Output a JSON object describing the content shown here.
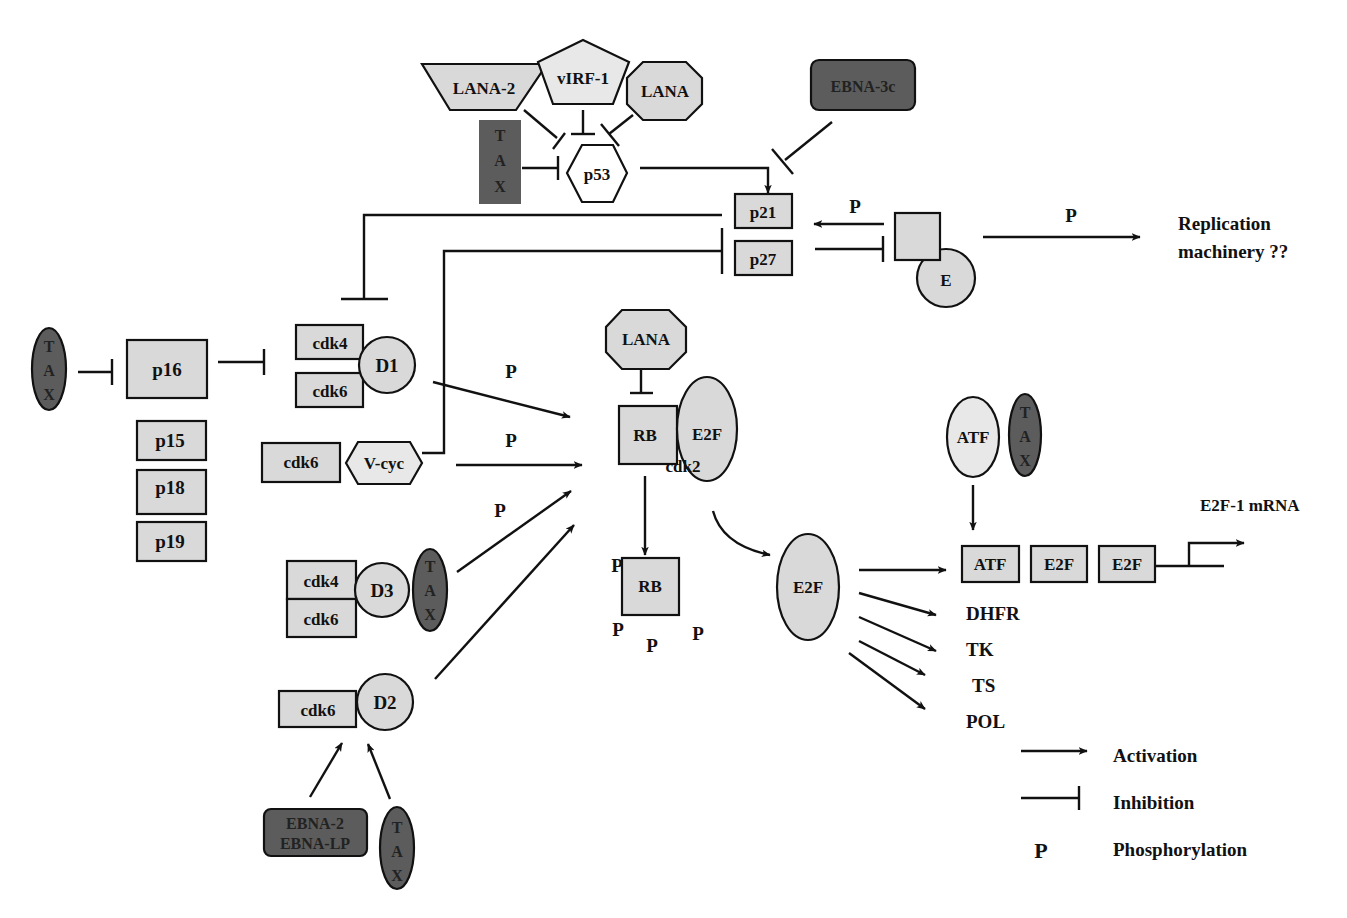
{
  "nodes": {
    "lana2": "LANA-2",
    "virf1": "vIRF-1",
    "lana_top": "LANA",
    "ebna3c": "EBNA-3c",
    "tax_top": [
      "T",
      "A",
      "X"
    ],
    "p53": "p53",
    "p21": "p21",
    "p27": "p27",
    "cyclin_e": "E",
    "tax_left": [
      "T",
      "A",
      "X"
    ],
    "p16": "p16",
    "p15": "p15",
    "p18": "p18",
    "p19": "p19",
    "cdk4_d1": "cdk4",
    "cdk6_d1": "cdk6",
    "d1": "D1",
    "cdk6_vcyc": "cdk6",
    "vcyc": "V-cyc",
    "cdk4_d3": "cdk4",
    "cdk6_d3": "cdk6",
    "d3": "D3",
    "tax_d3": [
      "T",
      "A",
      "X"
    ],
    "cdk6_d2": "cdk6",
    "d2": "D2",
    "ebna2_line1": "EBNA-2",
    "ebna2_line2": "EBNA-LP",
    "tax_bottom": [
      "T",
      "A",
      "X"
    ],
    "lana_mid": "LANA",
    "rb": "RB",
    "e2f_complex": "E2F",
    "cdk2": "cdk2",
    "rb_phos": "RB",
    "e2f_free": "E2F",
    "atf": "ATF",
    "tax_atf": [
      "T",
      "A",
      "X"
    ],
    "promoter_atf": "ATF",
    "promoter_e2f1": "E2F",
    "promoter_e2f2": "E2F"
  },
  "labels": {
    "replication_line1": "Replication",
    "replication_line2": "machinery ??",
    "e2f1_mrna": "E2F-1 mRNA",
    "phospho": "P",
    "targets": [
      "DHFR",
      "TK",
      "TS",
      "POL"
    ]
  },
  "legend": {
    "activation": "Activation",
    "inhibition": "Inhibition",
    "phosphorylation_symbol": "P",
    "phosphorylation": "Phosphorylation"
  },
  "colors": {
    "light_fill": "#d9d9d9",
    "dark_fill": "#5c5c5c",
    "line": "#111111"
  }
}
